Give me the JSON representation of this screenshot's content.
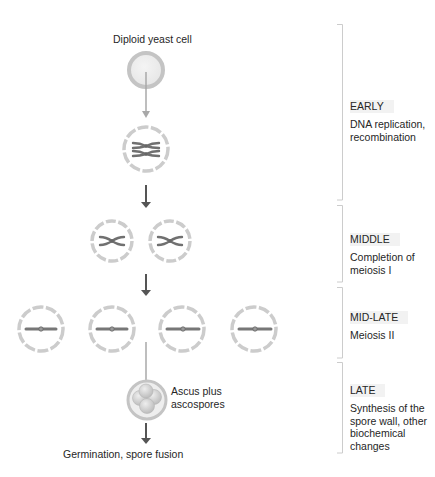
{
  "labels": {
    "top": "Diploid yeast cell",
    "ascus": "Ascus plus\nascospores",
    "ascus_line1": "Ascus plus",
    "ascus_line2": "ascospores",
    "bottom": "Germination, spore fusion"
  },
  "stages": [
    {
      "title": "EARLY",
      "desc_lines": [
        "DNA replication,",
        "recombination"
      ],
      "bracket": [
        24,
        200
      ]
    },
    {
      "title": "MIDDLE",
      "desc_lines": [
        "Completion of",
        "meiosis I"
      ],
      "bracket": [
        205,
        282
      ]
    },
    {
      "title": "MID-LATE",
      "desc_lines": [
        "Meiosis II"
      ],
      "bracket": [
        287,
        358
      ]
    },
    {
      "title": "LATE",
      "desc_lines": [
        "Synthesis of the",
        "spore wall, other",
        "biochemical",
        "changes"
      ],
      "bracket": [
        362,
        453
      ]
    }
  ],
  "colors": {
    "membrane": "#c8c8c8",
    "chromosome": "#7a7a7a",
    "arrow_light": "#a8a8a8",
    "arrow_dark": "#555555",
    "bracket": "#cccccc",
    "title_bg": "#f2f2f2"
  }
}
